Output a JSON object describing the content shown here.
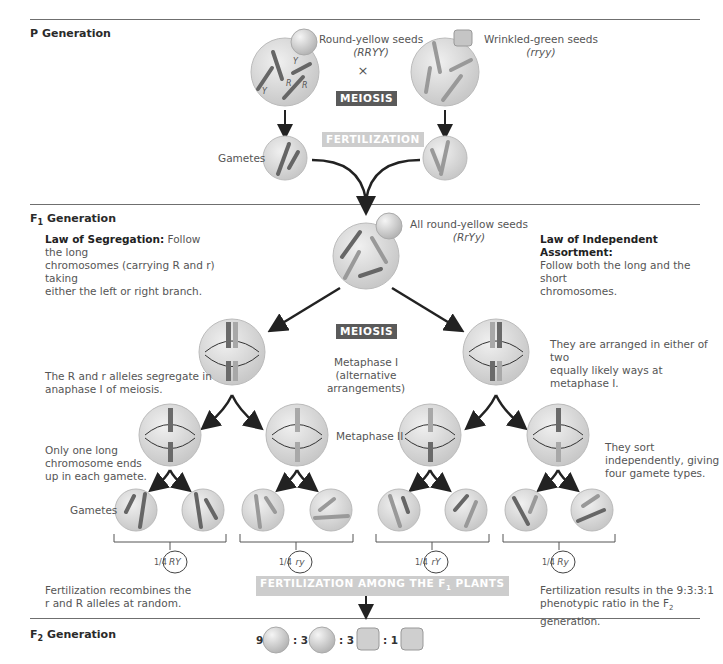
{
  "sections": {
    "p_generation": "P Generation",
    "f1_generation": "F",
    "f1_sub": "1",
    "f1_suffix": " Generation",
    "f2_generation": "F",
    "f2_sub": "2",
    "f2_suffix": " Generation"
  },
  "p_gen": {
    "parent1_label": "Round-yellow seeds",
    "parent1_genotype": "(RRYY)",
    "parent2_label": "Wrinkled-green seeds",
    "parent2_genotype": "(rryy)",
    "cross_symbol": "×",
    "meiosis_label": "MEIOSIS",
    "fertilization_label": "FERTILIZATION",
    "gametes_label": "Gametes"
  },
  "f1_gen": {
    "seed_label": "All round-yellow seeds",
    "genotype": "(RrYy)",
    "meiosis_label": "MEIOSIS",
    "metaphase1_label": "Metaphase I",
    "metaphase1_sub": "(alternative",
    "metaphase1_sub2": "arrangements)",
    "metaphase2_label": "Metaphase II",
    "gametes_label": "Gametes"
  },
  "notes": {
    "segregation_title": "Law of Segregation:",
    "segregation_text1": " Follow the long",
    "segregation_text2": "chromosomes (carrying R and r) taking",
    "segregation_text3": "either the left or right branch.",
    "independent_title": "Law of Independent Assortment:",
    "independent_text1": "Follow both the long and the short",
    "independent_text2": "chromosomes.",
    "segregate_note1": "The R and r alleles segregate in",
    "segregate_note2": "anaphase I of meiosis.",
    "arranged_note1": "They are arranged in either of two",
    "arranged_note2": "equally likely ways at metaphase I.",
    "one_long_note1": "Only one long",
    "one_long_note2": "chromosome ends",
    "one_long_note3": "up in each gamete.",
    "sort_note1": "They sort",
    "sort_note2": "independently, giving",
    "sort_note3": "four gamete types.",
    "recombine_note1": "Fertilization recombines the",
    "recombine_note2": "r and R alleles at random.",
    "ratio_note1": "Fertilization results in the 9:3:3:1",
    "ratio_note2": "phenotypic ratio in the F",
    "ratio_note2_sub": "2",
    "ratio_note2_end": " generation."
  },
  "gamete_types": [
    {
      "fraction": "1/4",
      "genotype": "RY"
    },
    {
      "fraction": "1/4",
      "genotype": "ry"
    },
    {
      "fraction": "1/4",
      "genotype": "rY"
    },
    {
      "fraction": "1/4",
      "genotype": "Ry"
    }
  ],
  "fertilization_f1": "FERTILIZATION AMONG THE F",
  "fertilization_f1_sub": "1",
  "fertilization_f1_end": " PLANTS",
  "f2_ratio": [
    {
      "count": "9",
      "phenotype": "round-yellow"
    },
    {
      "count": ": 3",
      "phenotype": "round-green"
    },
    {
      "count": ": 3",
      "phenotype": "wrinkled-yellow"
    },
    {
      "count": ": 1",
      "phenotype": "wrinkled-green"
    }
  ],
  "colors": {
    "cell_fill": "#dcdcdc",
    "chrom_dark": "#6a6a6a",
    "chrom_light": "#a8a8a8",
    "meiosis_box": "#5a5a5a",
    "fertilization_box": "#cdcdcd",
    "rule": "#6f6f6f"
  }
}
